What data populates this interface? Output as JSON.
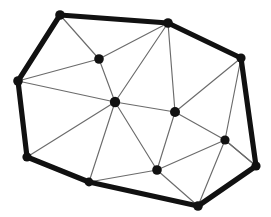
{
  "figure": {
    "type": "planar-triangulation-diagram",
    "width": 271,
    "height": 217,
    "background_color": "#ffffff",
    "boundary_color": "#111111",
    "interior_edge_color": "#6b6b6b",
    "vertex_color": "#111111",
    "boundary_stroke_width": 5.2,
    "interior_stroke_width": 1.15,
    "vertex_radius_boundary": 4.6,
    "vertex_radius_interior": 4.4,
    "vertex_count": 14,
    "boundary_vertex_count": 9,
    "interior_vertex_count": 5,
    "edge_count": 30,
    "triangle_count": 17
  },
  "vertices": [
    {
      "id": "v0",
      "label": "top-left-corner",
      "x": 60,
      "y": 15,
      "kind": "boundary",
      "r": 4.8
    },
    {
      "id": "v1",
      "label": "top-apex",
      "x": 168,
      "y": 23,
      "kind": "boundary",
      "r": 4.8
    },
    {
      "id": "v2",
      "label": "upper-right-corner",
      "x": 241,
      "y": 58,
      "kind": "boundary",
      "r": 4.6
    },
    {
      "id": "v3",
      "label": "lower-right-corner",
      "x": 256,
      "y": 166,
      "kind": "boundary",
      "r": 4.6
    },
    {
      "id": "v4",
      "label": "bottom-right-corner",
      "x": 198,
      "y": 206,
      "kind": "boundary",
      "r": 4.8
    },
    {
      "id": "v5",
      "label": "bottom-left-corner",
      "x": 89,
      "y": 182,
      "kind": "boundary",
      "r": 4.4
    },
    {
      "id": "v6",
      "label": "left-lower-corner",
      "x": 27,
      "y": 157,
      "kind": "boundary",
      "r": 4.6
    },
    {
      "id": "v7",
      "label": "left-corner",
      "x": 18,
      "y": 81,
      "kind": "boundary",
      "r": 4.8
    },
    {
      "id": "v8",
      "label": "interior-upper-left",
      "x": 99,
      "y": 59,
      "kind": "interior",
      "r": 4.8
    },
    {
      "id": "v9",
      "label": "interior-center",
      "x": 115,
      "y": 102,
      "kind": "interior",
      "r": 5.2
    },
    {
      "id": "v10",
      "label": "interior-mid-right",
      "x": 175,
      "y": 112,
      "kind": "interior",
      "r": 5.0
    },
    {
      "id": "v11",
      "label": "interior-right-lower",
      "x": 225,
      "y": 140,
      "kind": "interior",
      "r": 4.6
    },
    {
      "id": "v12",
      "label": "interior-bottom-mid",
      "x": 157,
      "y": 170,
      "kind": "interior",
      "r": 4.8
    }
  ],
  "boundary_cycle": [
    "v0",
    "v1",
    "v2",
    "v3",
    "v4",
    "v5",
    "v6",
    "v7"
  ],
  "boundary_edges": [
    {
      "from": "v0",
      "to": "v1"
    },
    {
      "from": "v1",
      "to": "v2"
    },
    {
      "from": "v2",
      "to": "v3"
    },
    {
      "from": "v3",
      "to": "v4"
    },
    {
      "from": "v4",
      "to": "v5"
    },
    {
      "from": "v5",
      "to": "v6"
    },
    {
      "from": "v6",
      "to": "v7"
    },
    {
      "from": "v7",
      "to": "v0"
    }
  ],
  "interior_edges": [
    {
      "from": "v0",
      "to": "v8"
    },
    {
      "from": "v7",
      "to": "v8"
    },
    {
      "from": "v8",
      "to": "v1"
    },
    {
      "from": "v8",
      "to": "v9"
    },
    {
      "from": "v7",
      "to": "v9"
    },
    {
      "from": "v1",
      "to": "v9"
    },
    {
      "from": "v1",
      "to": "v10"
    },
    {
      "from": "v2",
      "to": "v10"
    },
    {
      "from": "v9",
      "to": "v10"
    },
    {
      "from": "v10",
      "to": "v11"
    },
    {
      "from": "v2",
      "to": "v11"
    },
    {
      "from": "v3",
      "to": "v11"
    },
    {
      "from": "v11",
      "to": "v12"
    },
    {
      "from": "v10",
      "to": "v12"
    },
    {
      "from": "v9",
      "to": "v12"
    },
    {
      "from": "v12",
      "to": "v4"
    },
    {
      "from": "v12",
      "to": "v5"
    },
    {
      "from": "v9",
      "to": "v5"
    },
    {
      "from": "v9",
      "to": "v6"
    },
    {
      "from": "v11",
      "to": "v4"
    },
    {
      "from": "v3",
      "to": "v11"
    },
    {
      "from": "v2",
      "to": "v1"
    }
  ]
}
